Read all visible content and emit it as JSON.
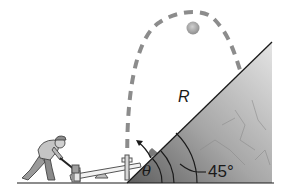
{
  "figure": {
    "labels": {
      "range": "R",
      "launch_angle": "θ",
      "incline_angle": "45°"
    },
    "colors": {
      "trajectory": "#8c8c8c",
      "ball": "#a8a8a8",
      "hill_dark": "#6e6e6e",
      "hill_light": "#d9d9d9",
      "line": "#1a1a1a",
      "background": "#ffffff"
    },
    "elements": {
      "person": "worker with sledgehammer",
      "seesaw": "launching seesaw",
      "trajectory": "dashed parabolic path",
      "ball": "projectile",
      "hill": "incline surface",
      "launch_arrow": "velocity direction arrow"
    }
  }
}
